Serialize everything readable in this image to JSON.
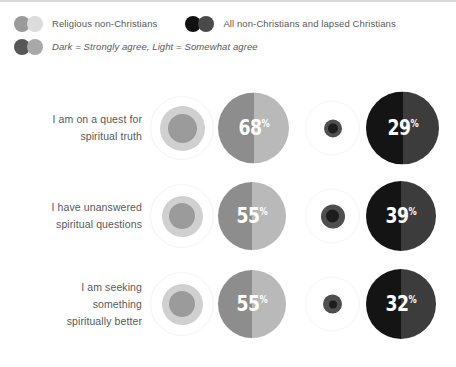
{
  "legend": {
    "rows": [
      {
        "entries": [
          {
            "dots": [
              "#9a9a9a",
              "#dcdcdc"
            ],
            "label": "Religious non-Christians",
            "italic": false
          },
          {
            "dots": [
              "#111111",
              "#4a4a4a"
            ],
            "label": "All non-Christians and lapsed Christians",
            "italic": false
          }
        ]
      },
      {
        "entries": [
          {
            "dots": [
              "#565656",
              "#a8a8a8"
            ],
            "label": "Dark = Strongly agree, Light = Somewhat agree",
            "italic": true
          }
        ]
      }
    ]
  },
  "colors": {
    "light_outer_ring": "#f4f4f4",
    "light_mid": "#d0d0d0",
    "light_core": "#9b9b9b",
    "light_split_left": "#8d8d8d",
    "light_split_right": "#b9b9b9",
    "dark_outer_ring": "#f4f4f4",
    "dark_mid": "#4f4f4f",
    "dark_core": "#1c1c1c",
    "dark_split_left": "#141414",
    "dark_split_right": "#3c3c3c",
    "label_text": "#58595b",
    "pct_text": "#ffffff",
    "top_border": "#d8d8d8"
  },
  "chart_data": {
    "type": "bubble",
    "title": "",
    "series": [
      {
        "name": "Religious non-Christians",
        "key": "religious"
      },
      {
        "name": "All non-Christians and lapsed Christians",
        "key": "all"
      }
    ],
    "note": "Dark = Strongly agree, Light = Somewhat agree",
    "categories": [
      "I am on a quest for spiritual truth",
      "I have unanswered spiritual questions",
      "I am seeking something spiritually better"
    ],
    "rows": [
      {
        "label_lines": [
          "I am on a quest for",
          "spiritual truth"
        ],
        "religious_small_size": 64,
        "religious_mid_size": 45,
        "religious_core_size": 29,
        "religious_value": 68,
        "religious_value_label": "68",
        "religious_big_size": 71,
        "all_small_size": 55,
        "all_mid_size": 18,
        "all_core_size": 10,
        "all_value": 29,
        "all_value_label": "29",
        "all_big_size": 73
      },
      {
        "label_lines": [
          "I have unanswered",
          "spiritual questions"
        ],
        "religious_small_size": 64,
        "religious_mid_size": 41,
        "religious_core_size": 26,
        "religious_value": 55,
        "religious_value_label": "55",
        "religious_big_size": 68,
        "all_small_size": 55,
        "all_mid_size": 24,
        "all_core_size": 13,
        "all_value": 39,
        "all_value_label": "39",
        "all_big_size": 70
      },
      {
        "label_lines": [
          "I am seeking",
          "something",
          "spiritually better"
        ],
        "religious_small_size": 64,
        "religious_mid_size": 41,
        "religious_core_size": 26,
        "religious_value": 55,
        "religious_value_label": "55",
        "religious_big_size": 68,
        "all_small_size": 55,
        "all_mid_size": 19,
        "all_core_size": 8,
        "all_value": 32,
        "all_value_label": "32",
        "all_big_size": 70
      }
    ],
    "percent_symbol": "%"
  }
}
